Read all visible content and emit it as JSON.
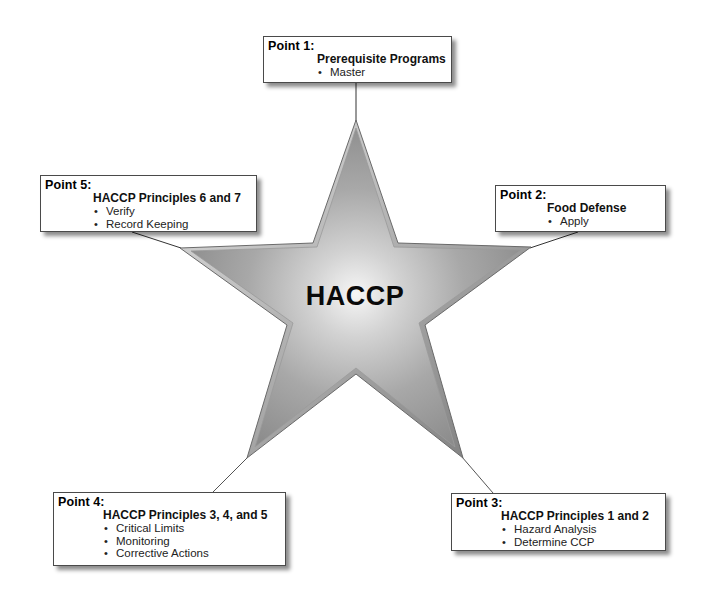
{
  "diagram": {
    "center_label": "HACCP",
    "colors": {
      "star_fill_light": "#f4f4f4",
      "star_fill_dark": "#8e8e8e",
      "star_edge": "#6a6a6a",
      "connector": "#333333",
      "box_border": "#4a4a4a"
    },
    "points": [
      {
        "id": 1,
        "title": "Point 1:",
        "heading": "Prerequisite Programs",
        "items": [
          "Master"
        ]
      },
      {
        "id": 2,
        "title": "Point 2:",
        "heading": "Food Defense",
        "items": [
          "Apply"
        ]
      },
      {
        "id": 3,
        "title": "Point 3:",
        "heading": "HACCP Principles 1 and 2",
        "items": [
          "Hazard Analysis",
          "Determine CCP"
        ]
      },
      {
        "id": 4,
        "title": "Point 4:",
        "heading": "HACCP Principles 3, 4, and 5",
        "items": [
          "Critical Limits",
          "Monitoring",
          "Corrective Actions"
        ]
      },
      {
        "id": 5,
        "title": "Point 5:",
        "heading": "HACCP Principles 6 and 7",
        "items": [
          "Verify",
          "Record Keeping"
        ]
      }
    ]
  }
}
